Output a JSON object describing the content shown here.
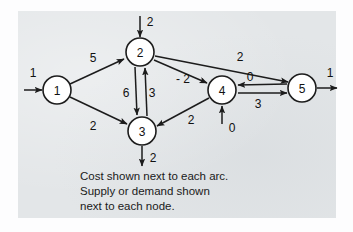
{
  "figure": {
    "type": "network-flow-diagram",
    "background_color": "#e3e6e8",
    "ink_color": "#1c1c1c",
    "node_fill": "#ffffff"
  },
  "nodes": [
    {
      "id": "1",
      "label": "1",
      "cx": 57,
      "cy": 90
    },
    {
      "id": "2",
      "label": "2",
      "cx": 140,
      "cy": 52
    },
    {
      "id": "3",
      "label": "3",
      "cx": 142,
      "cy": 131
    },
    {
      "id": "4",
      "label": "4",
      "cx": 222,
      "cy": 90
    },
    {
      "id": "5",
      "label": "5",
      "cx": 302,
      "cy": 88
    }
  ],
  "arcs": [
    {
      "from": "1",
      "to": "2",
      "cost": "5",
      "label_x": 93,
      "label_y": 58
    },
    {
      "from": "1",
      "to": "3",
      "cost": "2",
      "label_x": 93,
      "label_y": 126
    },
    {
      "from": "2",
      "to": "3",
      "cost": "6",
      "label_x": 126,
      "label_y": 93
    },
    {
      "from": "3",
      "to": "2",
      "cost": "3",
      "label_x": 152,
      "label_y": 93
    },
    {
      "from": "2",
      "to": "4",
      "cost": "- 2",
      "label_x": 183,
      "label_y": 79
    },
    {
      "from": "2",
      "to": "5",
      "cost": "2",
      "label_x": 240,
      "label_y": 57
    },
    {
      "from": "4",
      "to": "3",
      "cost": "2",
      "label_x": 191,
      "label_y": 120
    },
    {
      "from": "5",
      "to": "4",
      "cost": "0",
      "label_x": 250,
      "label_y": 77
    },
    {
      "from": "4",
      "to": "5",
      "cost": "3",
      "label_x": 258,
      "label_y": 104
    }
  ],
  "external_flows": [
    {
      "node": "1",
      "kind": "supply",
      "value": "1",
      "label_x": 33,
      "label_y": 73
    },
    {
      "node": "2",
      "kind": "supply",
      "value": "2",
      "label_x": 150,
      "label_y": 22
    },
    {
      "node": "3",
      "kind": "demand",
      "value": "2",
      "label_x": 153,
      "label_y": 158
    },
    {
      "node": "4",
      "kind": "supply",
      "value": "0",
      "label_x": 232,
      "label_y": 128
    },
    {
      "node": "5",
      "kind": "demand",
      "value": "1",
      "label_x": 330,
      "label_y": 73
    }
  ],
  "caption": {
    "lines": [
      "Cost shown next to each arc.",
      "Supply or demand shown",
      "next to each node."
    ],
    "x": 80,
    "y_start": 176,
    "line_height": 15
  }
}
